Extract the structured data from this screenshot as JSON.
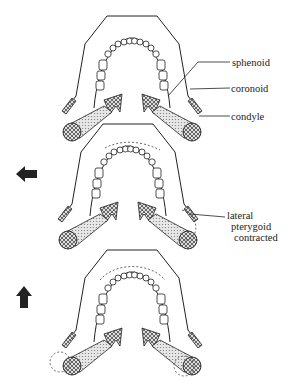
{
  "labels": {
    "sphenoid": "sphenoid",
    "coronoid": "coronoid",
    "condyle": "condyle",
    "lateral_pterygoid_1": "lateral",
    "lateral_pterygoid_2": "pterygoid",
    "lateral_pterygoid_3": "contracted"
  },
  "panels": [
    {
      "id": "rest",
      "arrow": null
    },
    {
      "id": "lateral-shift",
      "arrow": "left-arrow"
    },
    {
      "id": "protrusion",
      "arrow": "up-arrow"
    }
  ],
  "colors": {
    "ink": "#222222",
    "fill": "#d8d8d8",
    "paper": "#ffffff"
  }
}
